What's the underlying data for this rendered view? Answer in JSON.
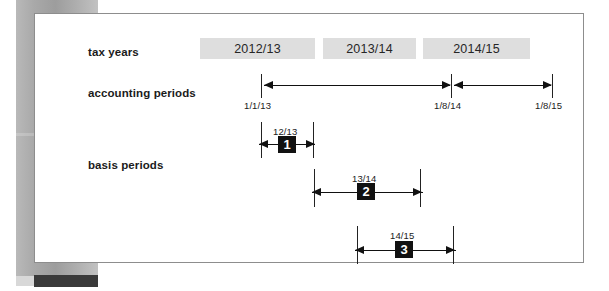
{
  "figure": {
    "title": "",
    "labels": {
      "tax_years": "tax years",
      "accounting_periods": "accounting periods",
      "basis_periods": "basis periods"
    }
  },
  "tax_years": [
    {
      "label": "2012/13"
    },
    {
      "label": "2013/14"
    },
    {
      "label": "2014/15"
    }
  ],
  "accounting_periods": {
    "date_markers": [
      {
        "label": "1/1/13"
      },
      {
        "label": "1/8/14"
      },
      {
        "label": "1/8/15"
      }
    ],
    "spans": [
      {
        "from": "1/1/13",
        "to": "1/8/14"
      },
      {
        "from": "1/8/14",
        "to": "1/8/15"
      }
    ]
  },
  "basis_periods": [
    {
      "number": "1",
      "label": "12/13"
    },
    {
      "number": "2",
      "label": "13/14"
    },
    {
      "number": "3",
      "label": "14/15"
    }
  ],
  "chart_data": {
    "type": "table",
    "xlabel": "",
    "ylabel": "",
    "rows": [
      {
        "row": "tax years",
        "items": [
          "2012/13",
          "2013/14",
          "2014/15"
        ]
      },
      {
        "row": "accounting periods",
        "items": [
          "1/1/13 → 1/8/14",
          "1/8/14 → 1/8/15"
        ]
      },
      {
        "row": "basis periods",
        "items": [
          "1 = 12/13",
          "2 = 13/14",
          "3 = 14/15"
        ]
      }
    ]
  },
  "colors": {
    "tax_year_box": "#dedede",
    "badge": "#111111",
    "badge_text": "#ffffff",
    "ink": "#1b1b1b",
    "card_border": "#8d8d8d",
    "scan_band": "#a9a9a9",
    "dark_bar": "#3a3a3a"
  }
}
